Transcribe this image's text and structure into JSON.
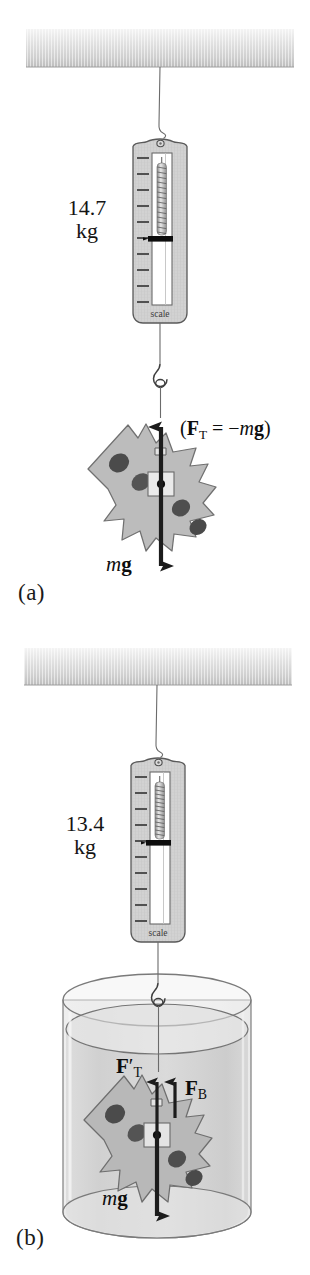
{
  "figure": {
    "panels": [
      {
        "id": "a",
        "label": "(a)",
        "scale_reading": "14.7",
        "scale_unit": "kg",
        "scale_word": "scale",
        "medium": "air",
        "forces": [
          {
            "name": "tension",
            "label_html": "(<b>F</b><sub>T</sub> = −<i>m</i><b>g</b>)",
            "direction": "up"
          },
          {
            "name": "weight",
            "label_html": "<i>m</i><b>g</b>",
            "direction": "down"
          }
        ]
      },
      {
        "id": "b",
        "label": "(b)",
        "scale_reading": "13.4",
        "scale_unit": "kg",
        "scale_word": "scale",
        "medium": "water",
        "forces": [
          {
            "name": "tension-prime",
            "label_html": "<b>F</b>′<sub>T</sub>",
            "direction": "up"
          },
          {
            "name": "buoyant",
            "label_html": "<b>F</b><sub>B</sub>",
            "direction": "up"
          },
          {
            "name": "weight",
            "label_html": "<i>m</i><b>g</b>",
            "direction": "down"
          }
        ]
      }
    ],
    "colors": {
      "ceiling_light": "#f0f0f0",
      "ceiling_dark": "#c9c9c9",
      "scale_body": "#cfcfcf",
      "scale_outline": "#5a5a5a",
      "window_fill": "#ffffff",
      "indicator": "#101010",
      "spring": "#9a9a9a",
      "rock_fill": "#b4b4b4",
      "rock_outline": "#6e6e6e",
      "pebble": "#4a4a4a",
      "arrow": "#1c1c1c",
      "water_fill": "#d8d8d8",
      "glass_outline": "#7a7a7a",
      "string": "#6b6b6b"
    }
  }
}
